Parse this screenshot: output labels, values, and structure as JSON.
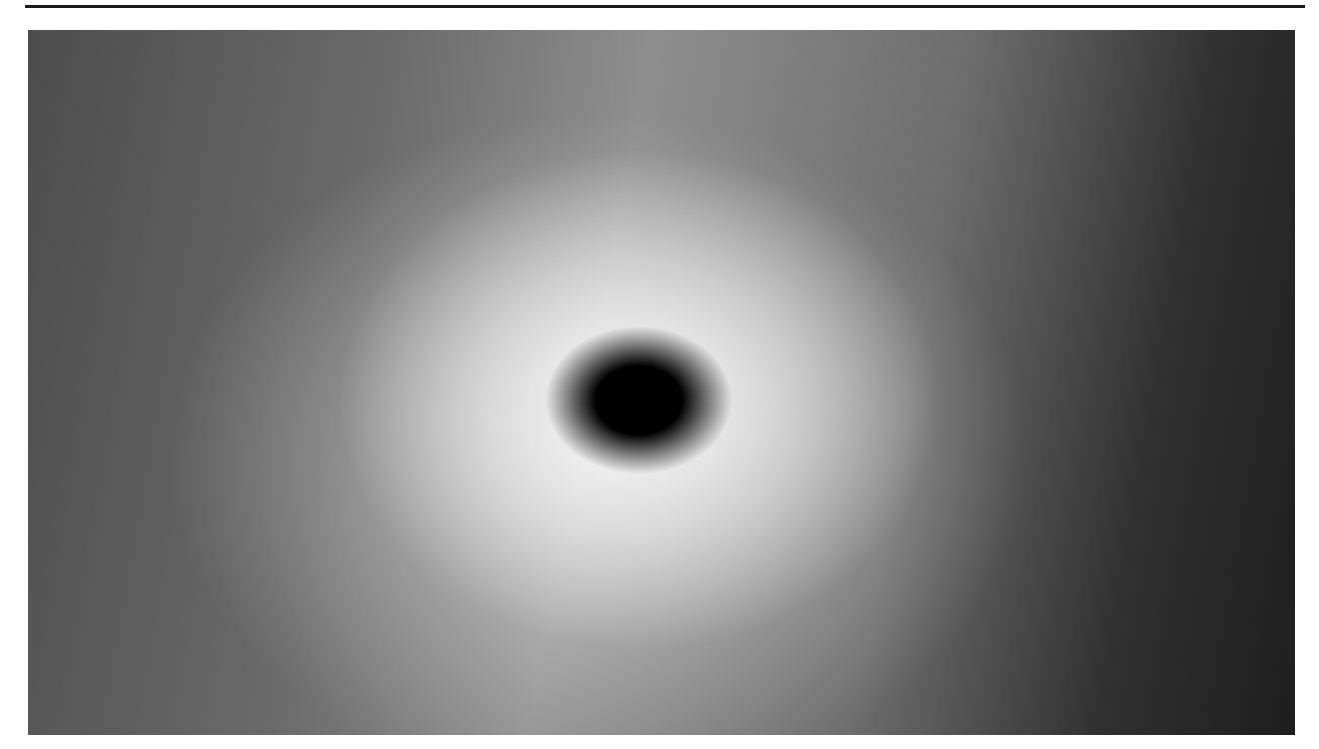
{
  "page": {
    "background_color": "#ffffff",
    "width": 1319,
    "height": 749
  },
  "rule": {
    "name": "top-horizontal-rule",
    "color": "#1a1a1a",
    "x": 25,
    "y": 5,
    "width": 1280,
    "height": 3
  },
  "plate": {
    "name": "photographic-plate",
    "caption": "",
    "x": 28,
    "y": 30,
    "width": 1267,
    "height": 705,
    "medium": "halftone-printed grayscale photograph",
    "grain": {
      "style": "coarse film grain / halftone dither",
      "cell_size_px": 3,
      "contrast": "high",
      "description": "dense speckled black-and-white grain covering the entire frame"
    },
    "palette": {
      "paper": "#ffffff",
      "ink_black": "#000000",
      "deep_shadow": "#121212",
      "dark_field": "#2a2a2a",
      "mid_grey": "#767676",
      "light_grey": "#b4b4b4",
      "highlight": "#f2f2f2",
      "smooth_lens_grey": "#8a8a8a"
    },
    "features": [
      {
        "name": "dark-nucleus",
        "label": "compact dark core",
        "center_x_pct": 48.2,
        "center_y_pct": 52.5,
        "radius_x_px": 30,
        "radius_y_px": 26,
        "tone": "#000000",
        "note": "saturated black blob at the centre of the halo"
      },
      {
        "name": "bright-halo",
        "label": "diffuse bright halo",
        "center_x_pct": 46.5,
        "center_y_pct": 56.0,
        "radius_x_px": 340,
        "radius_y_px": 285,
        "tone": "#f0f0f0",
        "note": "broad luminous envelope surrounding the nucleus, brightest just below and left of core"
      },
      {
        "name": "smooth-grey-lens",
        "label": "smooth lens-shaped grey region",
        "center_x_pct": 64.0,
        "center_y_pct": 45.5,
        "radius_x_px": 105,
        "radius_y_px": 55,
        "rotation_deg": -18,
        "tone": "#8a8a8a",
        "note": "low-grain elliptical shadow extending up-right from the nucleus"
      },
      {
        "name": "upper-bright-patch",
        "label": "small bright patch near top edge",
        "center_x_pct": 33.5,
        "center_y_pct": 5.5,
        "radius_x_px": 48,
        "radius_y_px": 30,
        "tone": "#e8e8e8"
      },
      {
        "name": "lower-bright-lobe",
        "label": "bright lobe below centre",
        "center_x_pct": 46.0,
        "center_y_pct": 72.0,
        "radius_x_px": 155,
        "radius_y_px": 110,
        "tone": "#ededed"
      },
      {
        "name": "dark-right-field",
        "label": "dark field along right edge",
        "center_x_pct": 93.0,
        "center_y_pct": 52.0,
        "tone": "#1c1c1c",
        "note": "strong vignette darkening across the right third of the plate"
      },
      {
        "name": "dark-left-field",
        "label": "medium-dark field along left edge",
        "center_x_pct": 5.0,
        "center_y_pct": 50.0,
        "tone": "#4a4a4a"
      },
      {
        "name": "dark-bottom-band",
        "label": "dark band along bottom edge",
        "center_x_pct": 50.0,
        "center_y_pct": 97.0,
        "tone": "#3a3a3a"
      },
      {
        "name": "core-tail",
        "label": "faint dark streak above the nucleus",
        "center_x_pct": 47.5,
        "center_y_pct": 44.0,
        "tone": "#3d3d3d"
      }
    ]
  }
}
